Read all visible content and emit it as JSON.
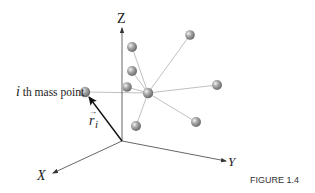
{
  "figure": {
    "caption": "FIGURE 1.4",
    "axes": {
      "z_label": "Z",
      "y_label": "Y",
      "x_label": "X"
    },
    "mass_point_label_italic": "i",
    "mass_point_label_rest": " th mass point",
    "vector_label": "r",
    "vector_subscript": "i",
    "vector_arrow": "→",
    "colors": {
      "ball": "#9a9a9a",
      "ball_highlight": "#e8e8e8",
      "link_line": "#b0b0b0",
      "axis_line": "#555555",
      "vector": "#111111"
    },
    "mass_points": [
      {
        "name": "ith-mass-point",
        "x": 85,
        "y": 92
      },
      {
        "name": "center",
        "x": 148,
        "y": 93
      },
      {
        "name": "upper-left-1",
        "x": 132,
        "y": 47
      },
      {
        "name": "upper-left-2",
        "x": 132,
        "y": 71
      },
      {
        "name": "upper-left-3",
        "x": 127,
        "y": 87
      },
      {
        "name": "top-right",
        "x": 190,
        "y": 35
      },
      {
        "name": "right",
        "x": 217,
        "y": 85
      },
      {
        "name": "lower-right",
        "x": 196,
        "y": 122
      },
      {
        "name": "lower",
        "x": 136,
        "y": 126
      }
    ]
  }
}
